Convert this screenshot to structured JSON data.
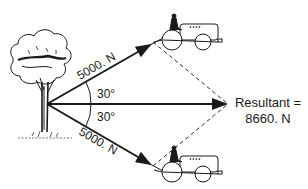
{
  "diagram": {
    "upper_force_label": "5000. N",
    "lower_force_label": "5000. N",
    "upper_angle_label": "30°",
    "lower_angle_label": "30°",
    "resultant_label_line1": "Resultant =",
    "resultant_label_line2": "8660. N",
    "objects": [
      "tree",
      "tractor-upper",
      "tractor-lower"
    ],
    "colors": {
      "ink": "#1a1a1a",
      "background": "#ffffff"
    }
  }
}
